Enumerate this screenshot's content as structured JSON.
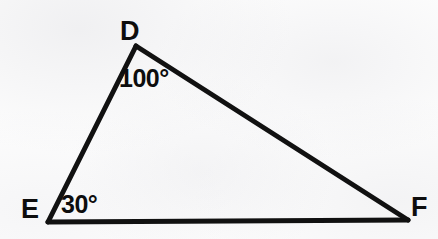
{
  "figure": {
    "type": "triangle-geometry-diagram",
    "shape_name": "triangle DEF",
    "stroke_color": "#111111",
    "background_color": "#fdfdfd",
    "vertices": [
      {
        "id": "D",
        "label": "D",
        "x": 136,
        "y": 46,
        "label_x": 120,
        "label_y": 18
      },
      {
        "id": "E",
        "label": "E",
        "x": 48,
        "y": 222,
        "label_x": 21,
        "label_y": 196
      },
      {
        "id": "F",
        "label": "F",
        "x": 408,
        "y": 220,
        "label_x": 411,
        "label_y": 194
      }
    ],
    "edges": [
      {
        "id": "DE",
        "from": "D",
        "to": "E"
      },
      {
        "id": "EF",
        "from": "E",
        "to": "F"
      },
      {
        "id": "FD",
        "from": "F",
        "to": "D"
      }
    ],
    "angles": [
      {
        "id": "angle-D",
        "at_vertex": "D",
        "value": "100°",
        "label_x": 119,
        "label_y": 66
      },
      {
        "id": "angle-E",
        "at_vertex": "E",
        "value": "30°",
        "label_x": 61,
        "label_y": 192
      }
    ]
  },
  "chart_data": {
    "type": "diagram",
    "title": "",
    "subtitle": "",
    "xlabel": "",
    "ylabel": "",
    "grid": false,
    "legend": "none",
    "points": [
      {
        "name": "D",
        "x": 136,
        "y": 46
      },
      {
        "name": "E",
        "x": 48,
        "y": 222
      },
      {
        "name": "F",
        "x": 408,
        "y": 220
      }
    ],
    "segments": [
      "D-E",
      "E-F",
      "F-D"
    ],
    "annotations": [
      "D",
      "E",
      "F",
      "100°",
      "30°"
    ],
    "measured_angles": {
      "D": 100,
      "E": 30
    }
  }
}
